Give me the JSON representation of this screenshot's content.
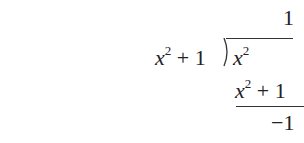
{
  "division": {
    "quotient": "1",
    "divisor_var": "x",
    "divisor_exp": "2",
    "divisor_rest": " + 1",
    "dividend_var": "x",
    "dividend_exp": "2",
    "product_var": "x",
    "product_exp": "2",
    "product_rest": " + 1",
    "remainder": "−1"
  }
}
